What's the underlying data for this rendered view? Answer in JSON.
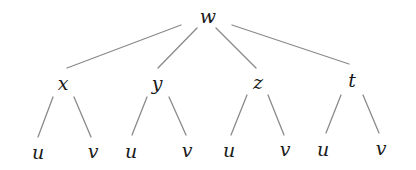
{
  "diagram": {
    "type": "tree",
    "root": {
      "label": "w",
      "children": [
        {
          "label": "x",
          "children": [
            {
              "label": "u"
            },
            {
              "label": "v"
            }
          ]
        },
        {
          "label": "y",
          "children": [
            {
              "label": "u"
            },
            {
              "label": "v"
            }
          ]
        },
        {
          "label": "z",
          "children": [
            {
              "label": "u"
            },
            {
              "label": "v"
            }
          ]
        },
        {
          "label": "t",
          "children": [
            {
              "label": "u"
            },
            {
              "label": "v"
            }
          ]
        }
      ]
    },
    "nodes": {
      "w": "w",
      "x": "x",
      "y": "y",
      "z": "z",
      "t": "t",
      "x_u": "u",
      "x_v": "v",
      "y_u": "u",
      "y_v": "v",
      "z_u": "u",
      "z_v": "v",
      "t_u": "u",
      "t_v": "v"
    },
    "edges": [
      [
        "w",
        "x"
      ],
      [
        "w",
        "y"
      ],
      [
        "w",
        "z"
      ],
      [
        "w",
        "t"
      ],
      [
        "x",
        "x_u"
      ],
      [
        "x",
        "x_v"
      ],
      [
        "y",
        "y_u"
      ],
      [
        "y",
        "y_v"
      ],
      [
        "z",
        "z_u"
      ],
      [
        "z",
        "z_v"
      ],
      [
        "t",
        "t_u"
      ],
      [
        "t",
        "t_v"
      ]
    ],
    "colors": {
      "edge": "#8a8a8a",
      "label": "#1a1a1a",
      "background": "#ffffff"
    }
  }
}
